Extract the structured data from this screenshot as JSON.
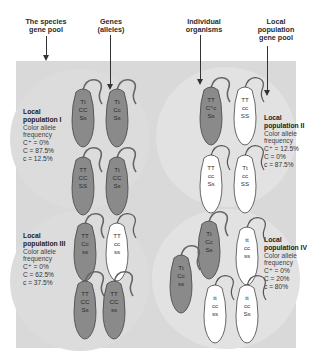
{
  "top_labels": [
    {
      "id": "species-gene-pool",
      "text": "The species\ngene pool"
    },
    {
      "id": "genes-alleles",
      "text": "Genes\n(alleles)"
    },
    {
      "id": "individual-organisms",
      "text": "Individual\norganisms"
    },
    {
      "id": "local-population-gene-pool",
      "text": "Local\npopulation\ngene pool"
    }
  ],
  "populations": [
    {
      "title": "Local population I",
      "subtitle1": "Color allele",
      "subtitle2": "frequency",
      "c_plus": "C⁺ = 0%",
      "C": "C = 87.5%",
      "c": "c = 12.5%",
      "mice": [
        {
          "genotype": [
            "Tt",
            "CC",
            "Ss"
          ],
          "color": "dark"
        },
        {
          "genotype": [
            "Tt",
            "Cc",
            "Ss"
          ],
          "color": "dark"
        },
        {
          "genotype": [
            "TT",
            "CC",
            "SS"
          ],
          "color": "dark"
        },
        {
          "genotype": [
            "Tt",
            "CC",
            "Ss"
          ],
          "color": "dark"
        }
      ]
    },
    {
      "title": "Local population II",
      "subtitle1": "Color allele",
      "subtitle2": "frequency",
      "c_plus": "C⁺ = 12.5%",
      "C": "C = 0%",
      "c": "c = 87.5%",
      "mice": [
        {
          "genotype": [
            "TT",
            "C⁺c",
            "Ss"
          ],
          "color": "dark"
        },
        {
          "genotype": [
            "TT",
            "cc",
            "SS"
          ],
          "color": "white"
        },
        {
          "genotype": [
            "TT",
            "cc",
            "Ss"
          ],
          "color": "white"
        },
        {
          "genotype": [
            "Tt",
            "cc",
            "SS"
          ],
          "color": "white"
        }
      ]
    },
    {
      "title": "Local population III",
      "subtitle1": "Color allele",
      "subtitle2": "frequency",
      "c_plus": "C⁺ = 0%",
      "C": "C = 62.5%",
      "c": "c = 37.5%",
      "mice": [
        {
          "genotype": [
            "TT",
            "Cc",
            "ss"
          ],
          "color": "dark"
        },
        {
          "genotype": [
            "TT",
            "cc",
            "ss"
          ],
          "color": "white"
        },
        {
          "genotype": [
            "TT",
            "CC",
            "Ss"
          ],
          "color": "dark"
        },
        {
          "genotype": [
            "TT",
            "CC",
            "ss"
          ],
          "color": "dark"
        }
      ]
    },
    {
      "title": "Local population IV",
      "subtitle1": "Color allele",
      "subtitle2": "frequency",
      "c_plus": "C⁺ = 0%",
      "C": "C = 20%",
      "c": "c = 80%",
      "mice": [
        {
          "genotype": [
            "Tt",
            "Cc",
            "Ss"
          ],
          "color": "dark"
        },
        {
          "genotype": [
            "tt",
            "cc",
            "ss"
          ],
          "color": "white"
        },
        {
          "genotype": [
            "Tt",
            "Cc",
            "ss"
          ],
          "color": "dark"
        },
        {
          "genotype": [
            "tt",
            "cc",
            "ss"
          ],
          "color": "white"
        },
        {
          "genotype": [
            "tt",
            "cc",
            "Ss"
          ],
          "color": "white"
        }
      ]
    }
  ],
  "colors": {
    "dark_mouse": "#8a8a8a",
    "white_mouse": "#ffffff",
    "panel": "#d9d9d9",
    "circle": "#e3e3e3",
    "outline": "#444444"
  }
}
